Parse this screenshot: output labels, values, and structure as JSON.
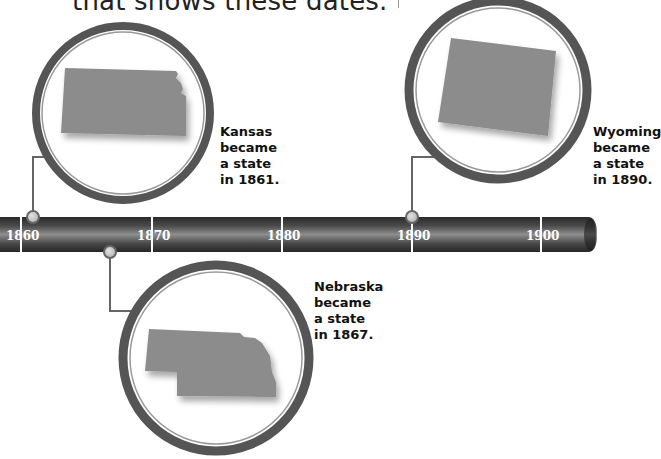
{
  "intro_text": "that shows these dates.",
  "timeline": {
    "ticks": [
      {
        "label": "1860",
        "x": 21
      },
      {
        "label": "1870",
        "x": 152
      },
      {
        "label": "1880",
        "x": 282
      },
      {
        "label": "1890",
        "x": 412
      },
      {
        "label": "1900",
        "x": 541
      }
    ],
    "colors": {
      "bar_dark": "#2b2b2b",
      "bar_light": "#8a8a8a",
      "ring": "#5a5a5a",
      "state_fill": "#8c8c8c",
      "connector": "#666666",
      "dot": "#c8c8c8"
    }
  },
  "events": [
    {
      "state": "Kansas",
      "year": "1861",
      "lines": [
        "Kansas",
        "became",
        "a state",
        "in 1861."
      ]
    },
    {
      "state": "Nebraska",
      "year": "1867",
      "lines": [
        "Nebraska",
        "became",
        "a state",
        "in 1867."
      ]
    },
    {
      "state": "Wyoming",
      "year": "1890",
      "lines": [
        "Wyoming",
        "became",
        "a state",
        "in 1890."
      ]
    }
  ]
}
